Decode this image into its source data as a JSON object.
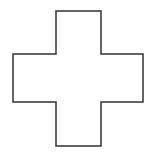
{
  "shape": {
    "name": "cross",
    "stroke_color": "#333333",
    "fill_color": "#ffffff",
    "stroke_width": 1.5,
    "points": "56,11 101,11 101,54 143,54 143,102 101,102 101,146 56,146 56,102 13,102 13,54 56,54"
  }
}
